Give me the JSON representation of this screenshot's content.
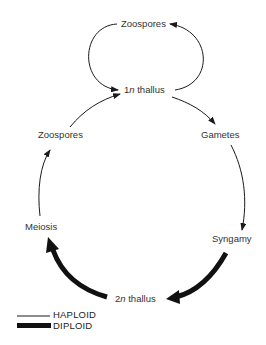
{
  "diagram": {
    "type": "life-cycle",
    "nodes": {
      "zoospores_top": "Zoospores",
      "thallus_1n_prefix": "1",
      "thallus_1n_italic": "n",
      "thallus_1n_suffix": " thallus",
      "zoospores_left": "Zoospores",
      "gametes": "Gametes",
      "meiosis": "Meiosis",
      "syngamy": "Syngamy",
      "thallus_2n_prefix": "2",
      "thallus_2n_italic": "n",
      "thallus_2n_suffix": " thallus"
    },
    "edges": [
      {
        "from": "1n thallus",
        "to": "Zoospores (top)",
        "phase": "haploid"
      },
      {
        "from": "Zoospores (top)",
        "to": "1n thallus",
        "phase": "haploid"
      },
      {
        "from": "1n thallus",
        "to": "Gametes",
        "phase": "haploid"
      },
      {
        "from": "Gametes",
        "to": "Syngamy",
        "phase": "haploid"
      },
      {
        "from": "Syngamy",
        "to": "2n thallus",
        "phase": "diploid"
      },
      {
        "from": "2n thallus",
        "to": "Meiosis",
        "phase": "diploid"
      },
      {
        "from": "Meiosis",
        "to": "Zoospores (left)",
        "phase": "haploid"
      },
      {
        "from": "Zoospores (left)",
        "to": "1n thallus",
        "phase": "haploid"
      }
    ],
    "legend": {
      "haploid": "HAPLOID",
      "diploid": "DIPLOID"
    },
    "colors": {
      "line": "#1a1a1a",
      "background": "#ffffff"
    }
  }
}
